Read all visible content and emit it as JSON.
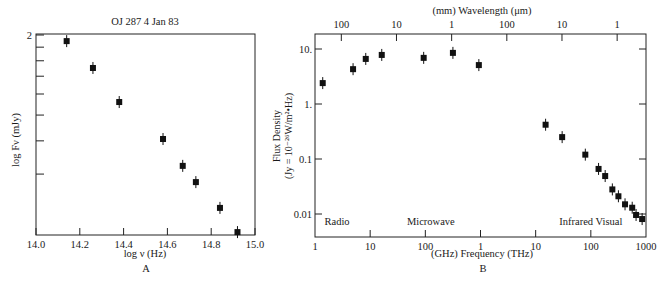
{
  "chart_data": [
    {
      "id": "A",
      "type": "scatter",
      "title": "OJ 287    4 Jan 83",
      "xlabel": "log ν (Hz)",
      "ylabel": "log Fν (mJy)",
      "panel_label": "A",
      "xlim": [
        14.0,
        15.0
      ],
      "ylim_log": [
        1.248,
        2.03
      ],
      "x_ticks": [
        14.0,
        14.2,
        14.4,
        14.6,
        14.8,
        15.0
      ],
      "x_tick_labels": [
        "14.0",
        "14.2",
        "14.4",
        "14.6",
        "14.8",
        "15.0"
      ],
      "y_tick_labels": [
        "2"
      ],
      "y_minor_ticks_mJy": [
        100,
        90,
        80,
        70,
        60,
        50,
        40,
        30
      ],
      "grid": false,
      "series": [
        {
          "name": "OJ 287",
          "x": [
            14.14,
            14.26,
            14.38,
            14.58,
            14.67,
            14.73,
            14.84,
            14.92
          ],
          "y": [
            1.977,
            1.876,
            1.748,
            1.609,
            1.508,
            1.447,
            1.35,
            1.259
          ]
        }
      ]
    },
    {
      "id": "B",
      "type": "scatter",
      "title": "(mm) Wavelength (μm)",
      "xlabel": "(GHz)  Frequency (THz)",
      "ylabel_line1": "Flux Density",
      "ylabel_line2": "(Jy = 10⁻²⁶W/m²•Hz)",
      "panel_label": "B",
      "x_scale": "log",
      "xlim_log_hz": [
        9,
        15
      ],
      "ylim_log": [
        -2.42,
        1.25
      ],
      "x_tick_labels": [
        "1",
        "10",
        "100",
        "1",
        "10",
        "100",
        "1000"
      ],
      "x_tick_log_hz": [
        9,
        10,
        11,
        12,
        13,
        14,
        15
      ],
      "top_tick_labels": [
        "100",
        "10",
        "1",
        "100",
        "10",
        "1"
      ],
      "top_tick_log_hz": [
        9.477,
        10.477,
        11.477,
        12.477,
        13.477,
        14.477
      ],
      "y_tick_labels": [
        "10.",
        "1.",
        "0.1",
        "0.01"
      ],
      "y_tick_log": [
        1,
        0,
        -1,
        -2
      ],
      "region_labels": [
        {
          "text": "Radio",
          "log_hz": 9.4
        },
        {
          "text": "Microwave",
          "log_hz": 11.1
        },
        {
          "text": "Infrared Visual",
          "log_hz": 14.0
        }
      ],
      "grid": false,
      "series": [
        {
          "name": "OJ 287 spectrum",
          "x_log_hz": [
            9.14,
            9.69,
            9.92,
            10.21,
            10.97,
            11.5,
            11.97,
            13.18,
            13.48,
            13.9,
            14.14,
            14.26,
            14.39,
            14.5,
            14.62,
            14.75,
            14.82,
            14.93
          ],
          "y_jy": [
            2.4,
            4.3,
            6.6,
            7.8,
            6.9,
            8.5,
            5.1,
            0.42,
            0.25,
            0.12,
            0.066,
            0.049,
            0.028,
            0.021,
            0.015,
            0.013,
            0.0096,
            0.0081
          ]
        }
      ]
    }
  ]
}
